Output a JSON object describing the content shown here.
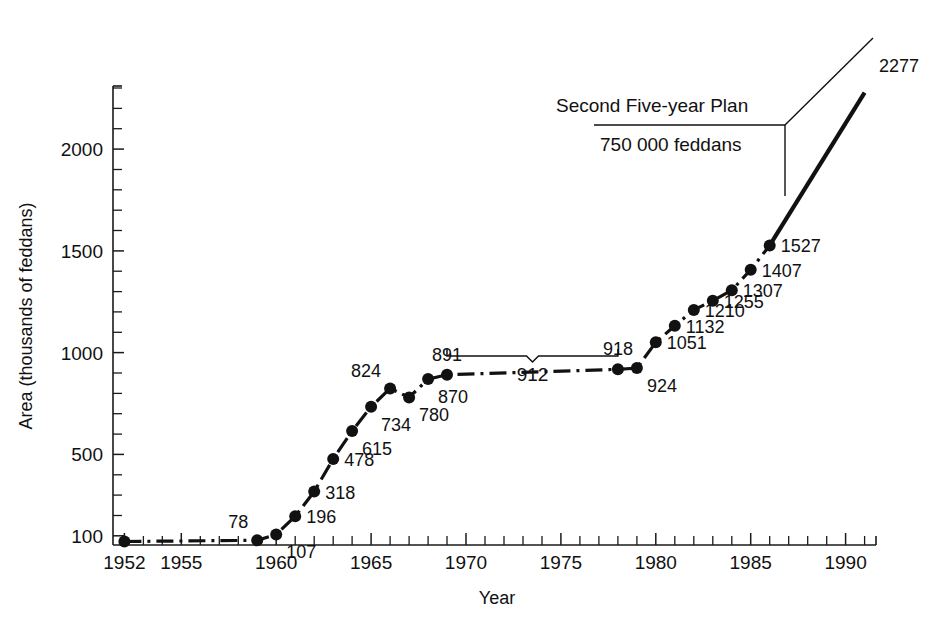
{
  "chart_data": {
    "type": "line",
    "title": "",
    "xlabel": "Year",
    "ylabel": "Area (thousands of feddans)",
    "xlim": [
      1951.4,
      1991.6
    ],
    "ylim": [
      55,
      2310
    ],
    "grid": false,
    "legend": "none",
    "x_tick_labels": [
      "1952",
      "1955",
      "1960",
      "1965",
      "1970",
      "1975",
      "1980",
      "1985",
      "1990"
    ],
    "x_tick_values": [
      1952,
      1955,
      1960,
      1965,
      1970,
      1975,
      1980,
      1985,
      1990
    ],
    "x_minor_tick_step": 1,
    "y_tick_labels": [
      "100",
      "500",
      "1000",
      "1500",
      "2000"
    ],
    "y_tick_values": [
      100,
      500,
      1000,
      1500,
      2000
    ],
    "y_minor_tick_step": 100,
    "series": [
      {
        "name": "Area under cultivation",
        "style": "dash-dot",
        "x": [
          1952,
          1959,
          1960,
          1961,
          1962,
          1963,
          1964,
          1965,
          1966,
          1967,
          1968,
          1969,
          1978,
          1979,
          1980,
          1981,
          1982,
          1983,
          1984,
          1985,
          1986
        ],
        "values": [
          72,
          78,
          107,
          196,
          318,
          478,
          615,
          734,
          824,
          780,
          870,
          891,
          918,
          924,
          1051,
          1132,
          1210,
          1255,
          1307,
          1407,
          1527
        ]
      }
    ],
    "point_labels": [
      {
        "year": 1959,
        "value": 78,
        "text": "78",
        "pos": "above-left"
      },
      {
        "year": 1960,
        "value": 107,
        "text": "107",
        "pos": "below-right"
      },
      {
        "year": 1961,
        "value": 196,
        "text": "196",
        "pos": "right"
      },
      {
        "year": 1962,
        "value": 318,
        "text": "318",
        "pos": "right"
      },
      {
        "year": 1963,
        "value": 478,
        "text": "478",
        "pos": "right"
      },
      {
        "year": 1964,
        "value": 615,
        "text": "615",
        "pos": "below-right"
      },
      {
        "year": 1965,
        "value": 734,
        "text": "734",
        "pos": "below-right"
      },
      {
        "year": 1966,
        "value": 824,
        "text": "824",
        "pos": "above-left"
      },
      {
        "year": 1967,
        "value": 780,
        "text": "780",
        "pos": "below-right"
      },
      {
        "year": 1968,
        "value": 870,
        "text": "870",
        "pos": "below-right"
      },
      {
        "year": 1969,
        "value": 891,
        "text": "891",
        "pos": "above"
      },
      {
        "year": 1978,
        "value": 918,
        "text": "918",
        "pos": "above"
      },
      {
        "year": 1979,
        "value": 924,
        "text": "924",
        "pos": "below-right"
      },
      {
        "year": 1980,
        "value": 1051,
        "text": "1051",
        "pos": "right"
      },
      {
        "year": 1981,
        "value": 1132,
        "text": "1132",
        "pos": "right"
      },
      {
        "year": 1982,
        "value": 1210,
        "text": "1210",
        "pos": "right"
      },
      {
        "year": 1983,
        "value": 1255,
        "text": "1255",
        "pos": "right"
      },
      {
        "year": 1984,
        "value": 1307,
        "text": "1307",
        "pos": "right"
      },
      {
        "year": 1985,
        "value": 1407,
        "text": "1407",
        "pos": "right"
      },
      {
        "year": 1986,
        "value": 1527,
        "text": "1527",
        "pos": "right"
      }
    ],
    "annotations": [
      {
        "id": "plateau-brace",
        "type": "brace",
        "label": "912",
        "x_start": 1969,
        "x_end": 1978,
        "note": "average area over the plateau years"
      },
      {
        "id": "second-plan-callout",
        "type": "callout",
        "line1": "Second Five-year Plan",
        "line2": "750 000 feddans",
        "target_year": 1986,
        "target_value": 1527
      },
      {
        "id": "projection",
        "type": "projection",
        "label": "2277",
        "from_year": 1986,
        "from_value": 1527,
        "to_year": 1991,
        "to_value": 2277
      }
    ]
  },
  "axis": {
    "x_title": "Year",
    "y_title": "Area (thousands of feddans)"
  }
}
